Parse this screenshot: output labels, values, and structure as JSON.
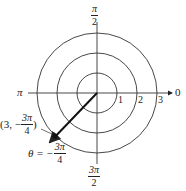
{
  "diagram": {
    "type": "polar-coordinate-plot",
    "center_px": [
      97,
      93
    ],
    "ring_radii": [
      1,
      2,
      3
    ],
    "ring_labels": [
      "1",
      "2",
      "3"
    ],
    "axis_labels": {
      "right": "0",
      "left": "π",
      "top": {
        "num": "π",
        "den": "2"
      },
      "bottom": {
        "num": "3π",
        "den": "2"
      }
    },
    "point": {
      "r": 3,
      "theta_label": "-3π/4",
      "coord_prefix": "(3, −",
      "coord_num": "3π",
      "coord_den": "4",
      "coord_suffix": ")"
    },
    "angle_label": {
      "prefix": "θ = −",
      "num": "3π",
      "den": "4"
    },
    "colors": {
      "line": "#222222",
      "background": "#ffffff"
    }
  }
}
